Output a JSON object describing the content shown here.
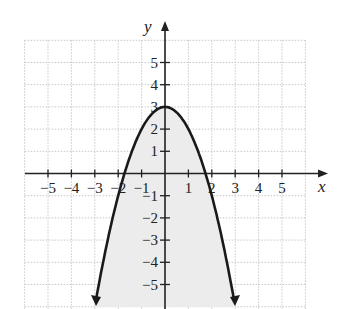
{
  "chart_data": {
    "type": "line",
    "title": "",
    "function": "y = 3 - x^2",
    "xlabel": "x",
    "ylabel": "y",
    "xlim": [
      -6,
      6
    ],
    "ylim": [
      -6,
      6
    ],
    "grid": true,
    "x_ticks": [
      -5,
      -4,
      -3,
      -2,
      -1,
      1,
      2,
      3,
      4,
      5
    ],
    "y_ticks": [
      -5,
      -4,
      -3,
      -2,
      -1,
      1,
      2,
      3,
      4,
      5
    ],
    "x_tick_labels": [
      "−5",
      "−4",
      "−3",
      "−2",
      "−1",
      "1",
      "2",
      "3",
      "4",
      "5"
    ],
    "y_tick_labels": [
      "−5",
      "−4",
      "−3",
      "−2",
      "−1",
      "1",
      "2",
      "3",
      "4",
      "5"
    ],
    "series": [
      {
        "name": "parabola",
        "x": [
          -3,
          -2.5,
          -2,
          -1.5,
          -1,
          -0.5,
          0,
          0.5,
          1,
          1.5,
          2,
          2.5,
          3
        ],
        "y": [
          -6,
          -3.25,
          -1,
          0.75,
          2,
          2.75,
          3,
          2.75,
          2,
          0.75,
          -1,
          -3.25,
          -6
        ],
        "vertex": [
          0,
          3
        ],
        "x_intercepts": [
          -1.73,
          1.73
        ],
        "arrows_at_ends": true
      }
    ],
    "shaded_region": "inside the parabola (y <= 3 - x^2)",
    "legend": null
  },
  "colors": {
    "curve": "#1a1a1a",
    "axis": "#222222",
    "grid": "#c8c8c8",
    "shade": "#ececec"
  }
}
